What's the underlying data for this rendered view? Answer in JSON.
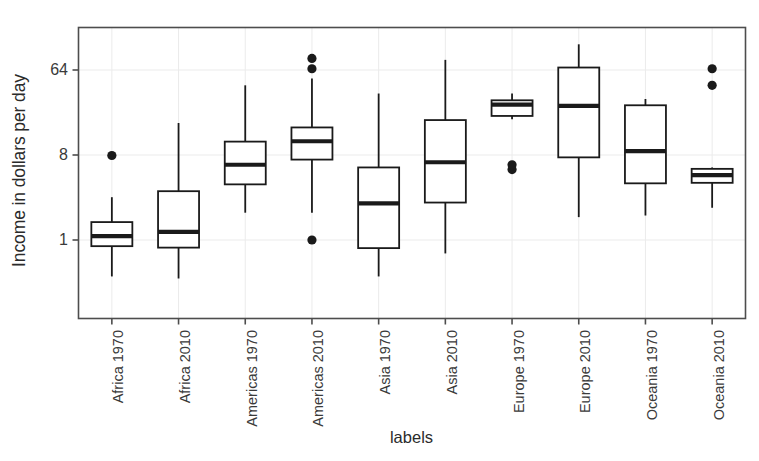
{
  "chart_data": {
    "type": "boxplot",
    "title": "",
    "xlabel": "labels",
    "ylabel": "Income in dollars per day",
    "yscale": "log",
    "log_base": 8,
    "ylim": [
      0.22,
      180
    ],
    "grid": true,
    "legend": "none",
    "ytick_labels": [
      "64",
      "8",
      "1"
    ],
    "ytick_values": [
      64,
      8,
      1
    ],
    "categories": [
      "Africa 1970",
      "Africa 2010",
      "Americas 1970",
      "Americas 2010",
      "Asia 1970",
      "Asia 2010",
      "Europe 1970",
      "Europe 2010",
      "Oceania 1970",
      "Oceania 2010"
    ],
    "boxes": [
      {
        "label": "Africa 1970",
        "whisker_low": 0.41,
        "q1": 0.86,
        "median": 1.1,
        "q3": 1.55,
        "whisker_high": 2.85,
        "outliers": [
          7.9
        ]
      },
      {
        "label": "Africa 2010",
        "whisker_low": 0.39,
        "q1": 0.83,
        "median": 1.22,
        "q3": 3.3,
        "whisker_high": 17.5,
        "outliers": []
      },
      {
        "label": "Americas 1970",
        "whisker_low": 1.95,
        "q1": 3.9,
        "median": 6.3,
        "q3": 11.1,
        "whisker_high": 44.0,
        "outliers": []
      },
      {
        "label": "Americas 2010",
        "whisker_low": 1.95,
        "q1": 7.15,
        "median": 11.2,
        "q3": 15.7,
        "whisker_high": 52.0,
        "outliers": [
          1.0,
          66.0,
          85.0
        ]
      },
      {
        "label": "Asia 1970",
        "whisker_low": 0.41,
        "q1": 0.82,
        "median": 2.45,
        "q3": 5.9,
        "whisker_high": 36.0,
        "outliers": []
      },
      {
        "label": "Asia 2010",
        "whisker_low": 0.72,
        "q1": 2.5,
        "median": 6.7,
        "q3": 18.8,
        "whisker_high": 82.0,
        "outliers": []
      },
      {
        "label": "Europe 1970",
        "whisker_low": 19.2,
        "q1": 20.8,
        "median": 27.5,
        "q3": 30.5,
        "whisker_high": 36.0,
        "outliers": [
          5.6,
          6.3
        ]
      },
      {
        "label": "Europe 2010",
        "whisker_low": 1.75,
        "q1": 7.55,
        "median": 26.6,
        "q3": 68.0,
        "whisker_high": 120.0,
        "outliers": []
      },
      {
        "label": "Oceania 1970",
        "whisker_low": 1.82,
        "q1": 4.0,
        "median": 8.8,
        "q3": 27.0,
        "whisker_high": 31.5,
        "outliers": []
      },
      {
        "label": "Oceania 2010",
        "whisker_low": 2.2,
        "q1": 4.05,
        "median": 4.9,
        "q3": 5.7,
        "whisker_high": 5.9,
        "outliers": [
          44.0,
          66.0
        ]
      }
    ],
    "colors": {
      "line": "#1a1a1a",
      "box_fill": "#ffffff",
      "grid": "#ebebeb",
      "frame": "#4d4d4d",
      "text": "#2b2b2b"
    }
  }
}
